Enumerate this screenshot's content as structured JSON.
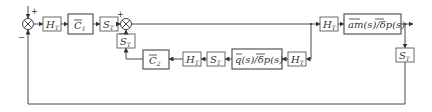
{
  "diagram": {
    "type": "block-diagram",
    "summing_junctions": [
      {
        "id": "sum1",
        "signs": {
          "top": "+",
          "bottom": "−"
        }
      },
      {
        "id": "sum2",
        "signs": {
          "left": "+",
          "bottom": "−"
        }
      }
    ],
    "blocks": {
      "ht1": {
        "main": "H",
        "sub": "T"
      },
      "c1": {
        "main": "C",
        "sub": "1",
        "overline": true
      },
      "st1": {
        "main": "S",
        "sub": "T"
      },
      "st_fb": {
        "main": "S",
        "sub": "T"
      },
      "c2": {
        "main": "C",
        "sub": "2",
        "overline": true
      },
      "ht_low1": {
        "main": "H",
        "sub": "T"
      },
      "st_low": {
        "main": "S",
        "sub": "T"
      },
      "q_delta": {
        "text": "q(s)/δp(s)",
        "label": "q̄(s)/δ̄p(s)"
      },
      "ht_low2": {
        "main": "H",
        "sub": "T"
      },
      "ht_up": {
        "main": "H",
        "sub": "T"
      },
      "am_delta": {
        "text": "am(s)/δp(s)",
        "label": "ām(s)/δ̄p(s)"
      },
      "st_out": {
        "main": "S",
        "sub": "T"
      }
    }
  }
}
